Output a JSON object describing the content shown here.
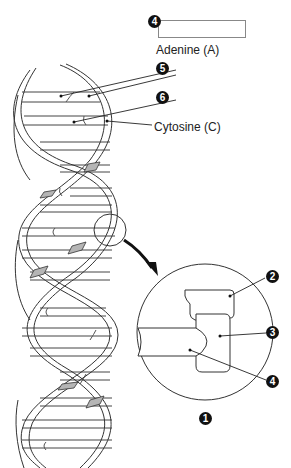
{
  "diagram": {
    "labels": {
      "adenine": "Adenine (A)",
      "cytosine": "Cytosine (C)"
    },
    "markers": {
      "m1": "1",
      "m2": "2",
      "m3": "3",
      "m4_top": "4",
      "m4_bottom": "4",
      "m5": "5",
      "m6": "6"
    },
    "answer_box": {
      "value": ""
    },
    "colors": {
      "line": "#333333",
      "shaded_backbone": "#b5b5b5",
      "marker_fill": "#111111"
    }
  }
}
